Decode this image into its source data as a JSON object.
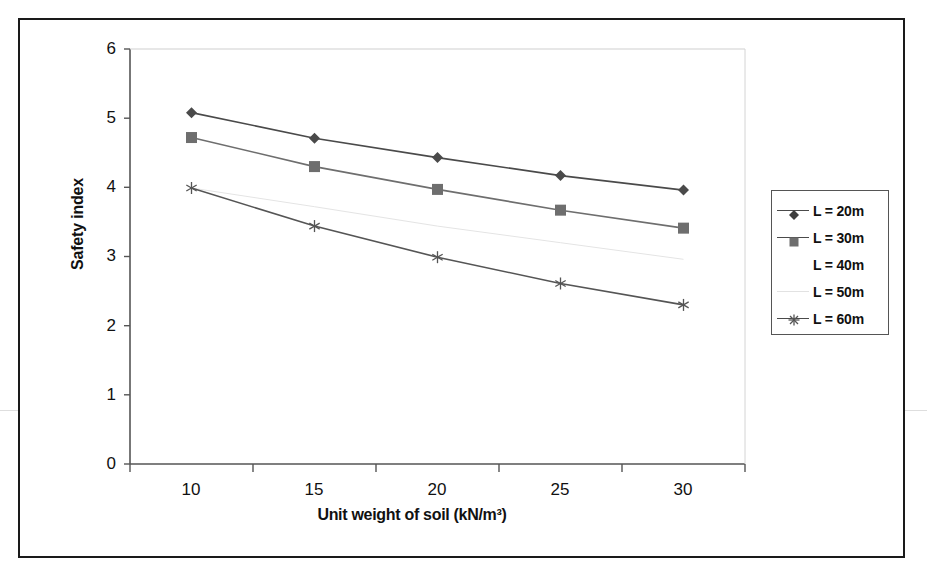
{
  "chart_data": {
    "type": "line",
    "title": "",
    "xlabel": "Unit weight of soil (kN/m³)",
    "ylabel": "Safety index",
    "x": [
      10,
      15,
      20,
      25,
      30
    ],
    "xlim": [
      7.5,
      32.5
    ],
    "ylim": [
      0,
      6
    ],
    "xticks": [
      "10",
      "15",
      "20",
      "25",
      "30"
    ],
    "yticks": [
      "0",
      "1",
      "2",
      "3",
      "4",
      "5",
      "6"
    ],
    "grid": false,
    "legend_position": "right",
    "series": [
      {
        "name": "L = 20m",
        "marker": "diamond",
        "color": "#4a4a4a",
        "values": [
          5.08,
          4.71,
          4.43,
          4.17,
          3.96
        ]
      },
      {
        "name": "L = 30m",
        "marker": "square",
        "color": "#6e6e6e",
        "values": [
          4.72,
          4.3,
          3.97,
          3.67,
          3.41
        ]
      },
      {
        "name": "L = 40m",
        "marker": "none",
        "color": "#ffffff",
        "values": [
          4.0,
          3.8,
          3.56,
          3.34,
          3.14
        ]
      },
      {
        "name": "L = 50m",
        "marker": "none",
        "color": "#e4e4e4",
        "values": [
          3.99,
          3.72,
          3.44,
          3.2,
          2.96
        ]
      },
      {
        "name": "L = 60m",
        "marker": "asterisk",
        "color": "#555555",
        "values": [
          3.99,
          3.44,
          2.99,
          2.61,
          2.3
        ]
      }
    ]
  },
  "legend": {
    "items": [
      {
        "label": "L = 20m",
        "marker": "diamond",
        "line": "solid"
      },
      {
        "label": "L = 30m",
        "marker": "square",
        "line": "solid"
      },
      {
        "label": "L = 40m",
        "marker": "none",
        "line": "none"
      },
      {
        "label": "L = 50m",
        "marker": "none",
        "line": "faint"
      },
      {
        "label": "L = 60m",
        "marker": "asterisk",
        "line": "solid"
      }
    ]
  },
  "axes": {
    "y_tick_labels": [
      "6",
      "5",
      "4",
      "3",
      "2",
      "1",
      "0"
    ],
    "x_tick_labels": [
      "10",
      "15",
      "20",
      "25",
      "30"
    ],
    "y_title": "Safety index",
    "x_title": "Unit weight of soil (kN/m³)"
  },
  "colors": {
    "frame": "#1a1a1a",
    "axis": "#555555",
    "series_1": "#4a4a4a",
    "series_2": "#6e6e6e",
    "series_5": "#555555",
    "faint": "#e4e4e4"
  }
}
